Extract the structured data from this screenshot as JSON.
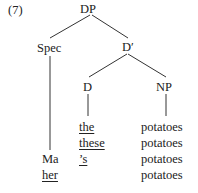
{
  "example_number": "(7)",
  "tree": {
    "root": "DP",
    "spec": "Spec",
    "dbar": "D′",
    "d": "D",
    "np": "NP"
  },
  "spec_words": [
    {
      "text": "Ma",
      "underlined": false
    },
    {
      "text": "her",
      "underlined": true
    }
  ],
  "d_words": [
    {
      "text": "the",
      "underlined": true
    },
    {
      "text": "these",
      "underlined": true
    },
    {
      "text": "’s",
      "underlined": true
    }
  ],
  "np_words": [
    "potatoes",
    "potatoes",
    "potatoes",
    "potatoes"
  ],
  "colors": {
    "line": "#333333",
    "text": "#222222"
  }
}
